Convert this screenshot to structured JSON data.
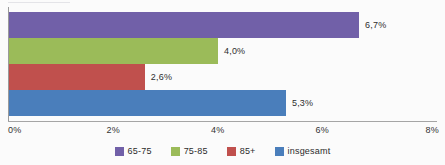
{
  "chart_data": {
    "type": "bar",
    "orientation": "horizontal",
    "title": "",
    "subtitle": "",
    "xlabel": "",
    "ylabel": "",
    "xlim": [
      0,
      8
    ],
    "xticks": [
      "0%",
      "2%",
      "4%",
      "6%",
      "8%"
    ],
    "xtick_values": [
      0,
      2,
      4,
      6,
      8
    ],
    "grid": false,
    "legend_position": "bottom",
    "categories": [
      "65-75",
      "75-85",
      "85+",
      "insgesamt"
    ],
    "values": [
      6.7,
      4.0,
      2.6,
      5.3
    ],
    "data_labels": [
      "6,7%",
      "4,0%",
      "2,6%",
      "5,3%"
    ],
    "colors": [
      "#7160a8",
      "#9bbb59",
      "#c0504d",
      "#4a7ebb"
    ],
    "series": [
      {
        "name": "65-75",
        "value": 6.7,
        "label": "6,7%",
        "color": "#7160a8"
      },
      {
        "name": "75-85",
        "value": 4.0,
        "label": "4,0%",
        "color": "#9bbb59"
      },
      {
        "name": "85+",
        "value": 2.6,
        "label": "2,6%",
        "color": "#c0504d"
      },
      {
        "name": "insgesamt",
        "value": 5.3,
        "label": "5,3%",
        "color": "#4a7ebb"
      }
    ],
    "legend": [
      {
        "label": "65-75",
        "color": "#7160a8"
      },
      {
        "label": "75-85",
        "color": "#9bbb59"
      },
      {
        "label": "85+",
        "color": "#c0504d"
      },
      {
        "label": "insgesamt",
        "color": "#4a7ebb"
      }
    ],
    "axis_color": "#9a9a9a",
    "background": "#fbfbfb"
  }
}
